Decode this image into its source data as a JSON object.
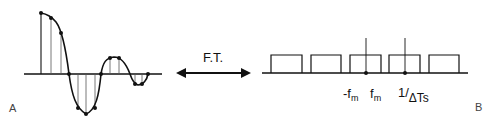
{
  "panels": {
    "left_label": "A",
    "right_label": "B"
  },
  "transform": {
    "label": "F.T.",
    "arrow": "double-headed-arrow"
  },
  "time_domain": {
    "description": "sampled decaying oscillating signal with vertical sample lines",
    "axis": {
      "x1": 24,
      "x2": 162,
      "y": 74
    },
    "sample_points": [
      [
        41,
        13
      ],
      [
        51,
        18
      ],
      [
        61,
        33
      ],
      [
        69,
        74
      ],
      [
        78,
        108
      ],
      [
        86,
        114
      ],
      [
        95,
        108
      ],
      [
        101,
        74
      ],
      [
        110,
        58
      ],
      [
        119,
        58
      ],
      [
        130,
        74
      ],
      [
        135,
        84
      ],
      [
        142,
        84
      ],
      [
        148,
        74
      ]
    ]
  },
  "frequency_domain": {
    "description": "periodic replicated rectangular spectra",
    "axis": {
      "x1": 262,
      "x2": 468,
      "y": 73
    },
    "rect_top_y": 55,
    "rects": [
      [
        271,
        302
      ],
      [
        311,
        341
      ],
      [
        350,
        381
      ],
      [
        389,
        420
      ],
      [
        429,
        459
      ]
    ],
    "markers": [
      {
        "x": 366,
        "tick_top": 38
      },
      {
        "x": 405,
        "tick_top": 38
      }
    ],
    "labels": {
      "neg_fm": {
        "prefix": "-f",
        "sub": "m"
      },
      "fm": {
        "prefix": "f",
        "sub": "m"
      },
      "inv_sampling": {
        "prefix": "1/",
        "sub": "ΔTs"
      }
    }
  }
}
